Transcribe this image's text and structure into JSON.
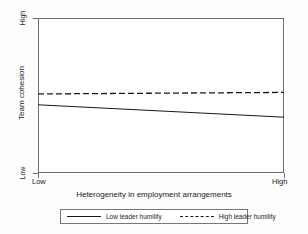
{
  "chart_data": {
    "type": "line",
    "title": "",
    "subtitle": "",
    "xlabel": "Heterogeneity in employment arrangements",
    "ylabel": "Team cohesion",
    "x": [
      "Low",
      "High"
    ],
    "xtick_labels": [
      "Low",
      "High"
    ],
    "ytick_labels": [
      "Low",
      "High"
    ],
    "xlim": [
      0,
      1
    ],
    "ylim": [
      0,
      1
    ],
    "grid": false,
    "legend_position": "bottom",
    "series": [
      {
        "name": "Low leader humility",
        "style": "solid",
        "color": "#1a1a1a",
        "values": [
          0.44,
          0.36
        ]
      },
      {
        "name": "High leader humility",
        "style": "dashed",
        "color": "#1a1a1a",
        "values": [
          0.51,
          0.52
        ]
      }
    ],
    "annotations": []
  },
  "axes": {
    "y_title": "Team cohesion",
    "y_high_label": "High",
    "y_low_label": "Low",
    "x_title": "Heterogeneity in employment arrangements",
    "x_low_label": "Low",
    "x_high_label": "High"
  },
  "legend": {
    "entries": [
      {
        "label": "Low leader humility",
        "style": "solid"
      },
      {
        "label": "High leader humility",
        "style": "dashed"
      }
    ]
  },
  "colors": {
    "line": "#1a1a1a",
    "frame": "#6e6e6e",
    "background": "#fdfdfd",
    "plot_background": "#ffffff"
  }
}
